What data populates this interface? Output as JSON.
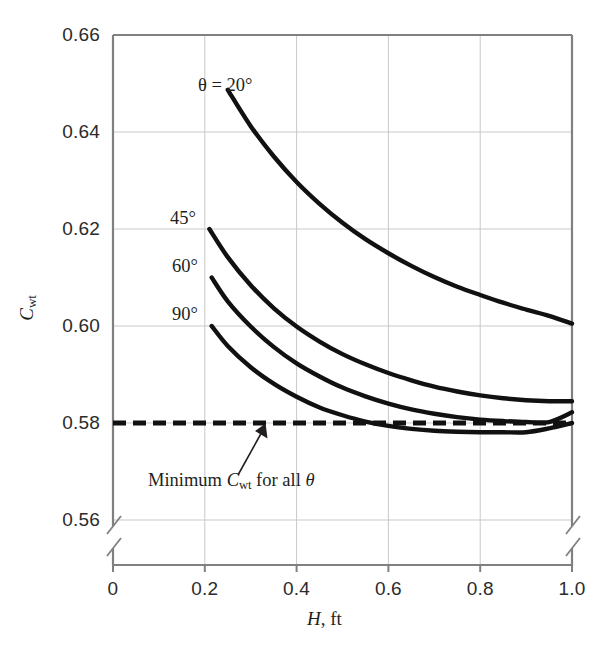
{
  "chart_data": {
    "type": "line",
    "title": "",
    "xlabel": "H, ft",
    "ylabel": "C_wt",
    "xlim": [
      0,
      1.0
    ],
    "ylim": [
      0.56,
      0.66
    ],
    "grid": true,
    "legend": "inline-curve-labels",
    "axis_break": {
      "y_below": 0.56,
      "note": "broken axis marks on left and right spines below 0.56"
    },
    "x_ticks": [
      "0",
      "0.2",
      "0.4",
      "0.6",
      "0.8",
      "1.0"
    ],
    "x_tick_values": [
      0,
      0.2,
      0.4,
      0.6,
      0.8,
      1.0
    ],
    "y_ticks": [
      "0.56",
      "0.58",
      "0.60",
      "0.62",
      "0.64",
      "0.66"
    ],
    "y_tick_values": [
      0.56,
      0.58,
      0.6,
      0.62,
      0.64,
      0.66
    ],
    "series": [
      {
        "name": "theta = 20 deg",
        "label": "θ = 20°",
        "x": [
          0.25,
          0.3,
          0.35,
          0.4,
          0.45,
          0.5,
          0.55,
          0.6,
          0.65,
          0.7,
          0.75,
          0.8,
          0.85,
          0.9,
          0.95,
          1.0
        ],
        "values": [
          0.6487,
          0.6412,
          0.635,
          0.6297,
          0.6252,
          0.6213,
          0.6179,
          0.615,
          0.6124,
          0.6101,
          0.6081,
          0.6064,
          0.6048,
          0.6034,
          0.6021,
          0.6005
        ]
      },
      {
        "name": "theta = 45 deg",
        "label": "45°",
        "x": [
          0.21,
          0.25,
          0.3,
          0.35,
          0.4,
          0.45,
          0.5,
          0.55,
          0.6,
          0.65,
          0.7,
          0.75,
          0.8,
          0.85,
          0.9,
          0.95,
          1.0
        ],
        "values": [
          0.62,
          0.6142,
          0.6084,
          0.6037,
          0.5999,
          0.5968,
          0.5942,
          0.5921,
          0.5903,
          0.5888,
          0.5875,
          0.5865,
          0.5857,
          0.5851,
          0.5847,
          0.5845,
          0.5845
        ]
      },
      {
        "name": "theta = 60 deg",
        "label": "60°",
        "x": [
          0.215,
          0.25,
          0.3,
          0.35,
          0.4,
          0.45,
          0.5,
          0.55,
          0.6,
          0.65,
          0.7,
          0.75,
          0.8,
          0.85,
          0.9,
          0.95,
          1.0
        ],
        "values": [
          0.61,
          0.6051,
          0.5999,
          0.5957,
          0.5923,
          0.5896,
          0.5873,
          0.5855,
          0.584,
          0.5828,
          0.5819,
          0.5812,
          0.5807,
          0.5804,
          0.5802,
          0.5802,
          0.5822
        ]
      },
      {
        "name": "theta = 90 deg",
        "label": "90°",
        "x": [
          0.215,
          0.25,
          0.3,
          0.35,
          0.4,
          0.45,
          0.5,
          0.55,
          0.6,
          0.65,
          0.7,
          0.75,
          0.8,
          0.85,
          0.9,
          0.95,
          1.0
        ],
        "values": [
          0.6,
          0.5959,
          0.5915,
          0.5881,
          0.5854,
          0.5832,
          0.5816,
          0.5803,
          0.5794,
          0.5788,
          0.5784,
          0.5782,
          0.5781,
          0.5781,
          0.5781,
          0.5789,
          0.58
        ]
      }
    ],
    "reference_line": {
      "name": "minimum-cwt-line",
      "value": 0.58,
      "style": "dashed",
      "annotation": "Minimum C_wt for all θ"
    }
  },
  "axes": {
    "y_label_main": "C",
    "y_label_sub": "wt",
    "x_label_main": "H",
    "x_label_rest": ", ft"
  },
  "ticks": {
    "y": [
      "0.66",
      "0.64",
      "0.62",
      "0.60",
      "0.58",
      "0.56"
    ],
    "x": [
      "0",
      "0.2",
      "0.4",
      "0.6",
      "0.8",
      "1.0"
    ]
  },
  "curve_labels": {
    "theta20": "θ = 20°",
    "theta45": "45°",
    "theta60": "60°",
    "theta90": "90°"
  },
  "annotation": {
    "prefix": "Minimum ",
    "symbol": "C",
    "symbol_sub": "wt",
    "suffix": " for all ",
    "theta": "θ"
  },
  "colors": {
    "curve": "#111111",
    "grid": "#c9c9c9",
    "spine": "#808080",
    "text": "#231f20",
    "background": "#ffffff"
  }
}
